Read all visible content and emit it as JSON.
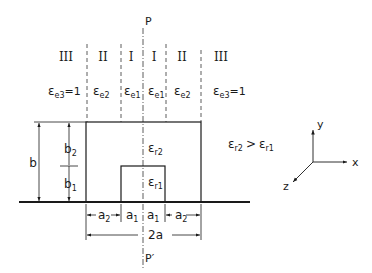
{
  "figure": {
    "region_labels": [
      "III",
      "II",
      "I",
      "I",
      "II",
      "III"
    ],
    "permittivity_labels": [
      {
        "sym": "ε",
        "sub": "e3",
        "suffix": "=1"
      },
      {
        "sym": "ε",
        "sub": "e2",
        "suffix": ""
      },
      {
        "sym": "ε",
        "sub": "e1",
        "suffix": ""
      },
      {
        "sym": "ε",
        "sub": "e1",
        "suffix": ""
      },
      {
        "sym": "ε",
        "sub": "e2",
        "suffix": ""
      },
      {
        "sym": "ε",
        "sub": "e3",
        "suffix": "=1"
      }
    ],
    "symmetry_top": "P",
    "symmetry_bottom": "P′",
    "outer_dielectric": {
      "sym": "ε",
      "sub": "r2"
    },
    "inner_dielectric": {
      "sym": "ε",
      "sub": "r1"
    },
    "relation": {
      "left_sym": "ε",
      "left_sub": "r2",
      "op": ">",
      "right_sym": "ε",
      "right_sub": "r1"
    },
    "vertical_dims": {
      "total": "b",
      "upper": "b",
      "upper_sub": "2",
      "lower": "b",
      "lower_sub": "1"
    },
    "horizontal_dims": [
      {
        "base": "a",
        "sub": "2"
      },
      {
        "base": "a",
        "sub": "1"
      },
      {
        "base": "a",
        "sub": "1"
      },
      {
        "base": "a",
        "sub": "2"
      }
    ],
    "total_width": "2a",
    "axes": {
      "x": "x",
      "y": "y",
      "z": "z"
    }
  }
}
